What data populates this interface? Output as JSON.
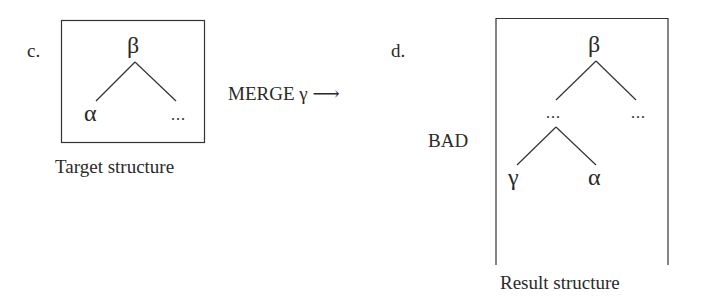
{
  "panel_c": {
    "label": "c.",
    "root": "β",
    "left_child": "α",
    "right_child": "...",
    "caption": "Target structure"
  },
  "operation": {
    "label": "MERGE γ",
    "arrow": "⟶"
  },
  "panel_d": {
    "label": "d.",
    "side_label": "BAD",
    "root": "β",
    "left_child": "...",
    "right_child": "...",
    "left_left": "γ",
    "left_right": "α",
    "caption": "Result structure"
  }
}
